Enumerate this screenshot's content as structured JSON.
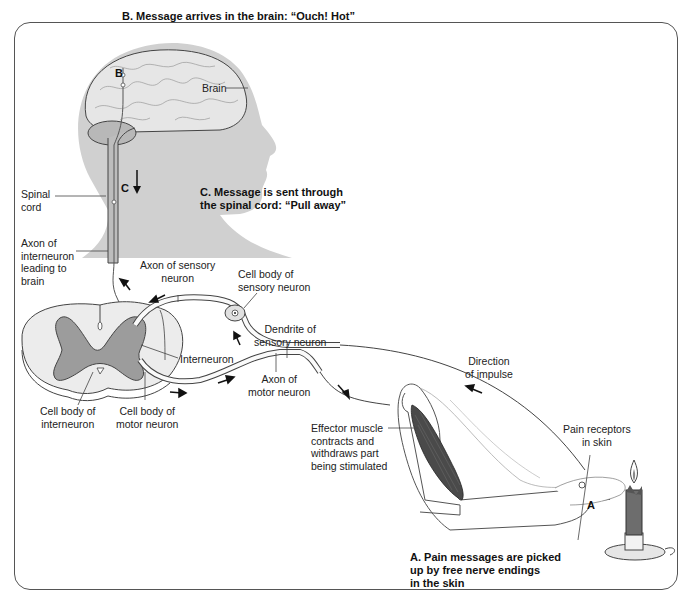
{
  "diagram": {
    "type": "reflex-arc",
    "captions": {
      "a": "A. Pain messages are picked\n    up by free nerve endings\nin the skin",
      "b": "B. Message arrives in the brain: “Ouch! Hot”",
      "c": "C. Message is sent through\n    the spinal cord: “Pull away”"
    },
    "letters": {
      "a": "A",
      "b": "B",
      "c": "C"
    },
    "labels": {
      "brain": "Brain",
      "spinal_cord": "Spinal\ncord",
      "axon_interneuron": "Axon of\ninterneuron\nleading to\nbrain",
      "axon_sensory": "Axon of sensory\nneuron",
      "cell_body_sensory": "Cell body of\nsensory neuron",
      "dendrite_sensory": "Dendrite of\nsensory neuron",
      "interneuron": "Interneuron",
      "cell_body_interneuron": "Cell body of\ninterneuron",
      "cell_body_motor": "Cell body of\nmotor neuron",
      "axon_motor": "Axon of\nmotor neuron",
      "direction_impulse": "Direction\nof impulse",
      "effector_muscle": "Effector muscle\ncontracts and\nwithdraws part\nbeing stimulated",
      "pain_receptors": "Pain receptors\nin skin"
    },
    "colors": {
      "head_silhouette": "#cfcfcf",
      "brain": "#e4e4e4",
      "gray_matter": "#9a9a9a",
      "white_matter": "#ebebeb",
      "muscle": "#444444",
      "outline": "#333333"
    }
  }
}
